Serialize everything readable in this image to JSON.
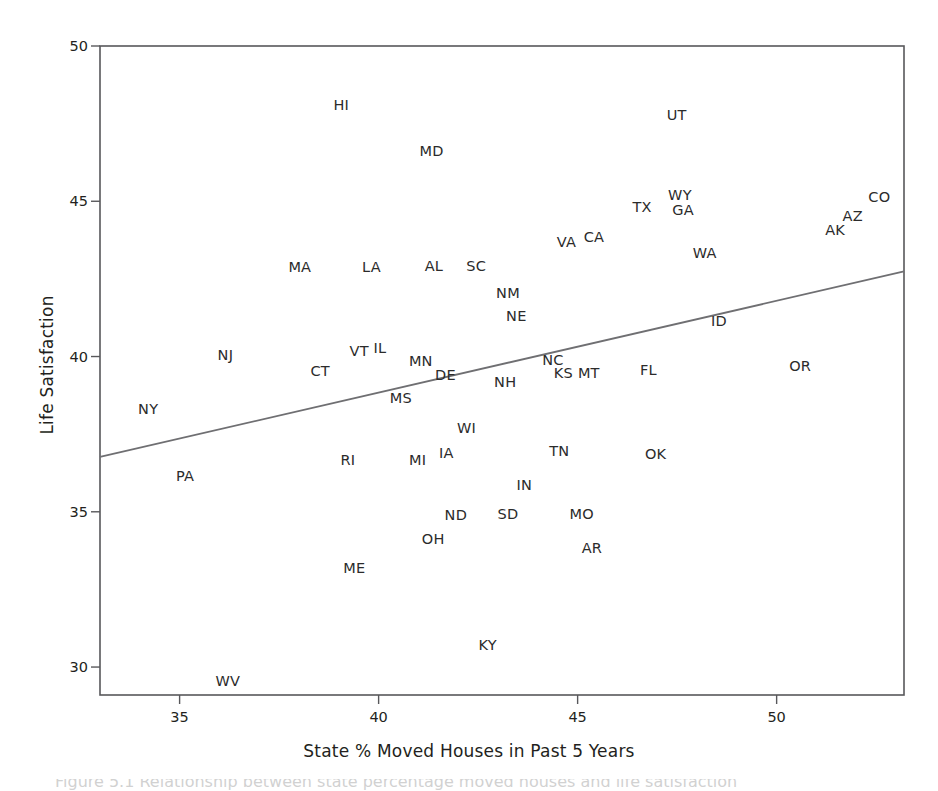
{
  "figure": {
    "background_color": "#ffffff",
    "ink_color": "#231f20",
    "line_color": "#6f6f72",
    "frame_color": "#58585b"
  },
  "caption": {
    "text": "Figure 5.1  Relationship between state percentage moved houses and life satisfaction"
  },
  "chart_data": {
    "type": "scatter",
    "title": "",
    "xlabel": "State % Moved Houses in Past 5 Years",
    "ylabel": "Life Satisfaction",
    "xlim": [
      33.0,
      53.2
    ],
    "ylim": [
      29.1,
      50.0
    ],
    "xticks": [
      35,
      40,
      45,
      50
    ],
    "xtick_labels": [
      "35",
      "40",
      "45",
      "50"
    ],
    "yticks": [
      30,
      35,
      40,
      45,
      50
    ],
    "ytick_labels": [
      "30",
      "35",
      "40",
      "45",
      "50"
    ],
    "grid": false,
    "legend": null,
    "point_marker": "text-label",
    "labels": [
      "HI",
      "UT",
      "MD",
      "CO",
      "WY",
      "TX",
      "GA",
      "AZ",
      "AK",
      "CA",
      "VA",
      "WA",
      "AL",
      "SC",
      "MA",
      "LA",
      "NM",
      "NE",
      "ID",
      "IL",
      "VT",
      "MN",
      "NJ",
      "NC",
      "DE",
      "CT",
      "OR",
      "FL",
      "MT",
      "KS",
      "NH",
      "MS",
      "NY",
      "WI",
      "IA",
      "TN",
      "OK",
      "MI",
      "RI",
      "PA",
      "IN",
      "SD",
      "MO",
      "ND",
      "AR",
      "OH",
      "ME",
      "KY",
      "WV"
    ],
    "points": [
      {
        "label": "HI",
        "x": 39.06,
        "y": 48.1
      },
      {
        "label": "UT",
        "x": 47.49,
        "y": 47.77
      },
      {
        "label": "MD",
        "x": 41.33,
        "y": 46.61
      },
      {
        "label": "CO",
        "x": 52.58,
        "y": 45.13
      },
      {
        "label": "WY",
        "x": 47.57,
        "y": 45.19
      },
      {
        "label": "TX",
        "x": 46.62,
        "y": 44.81
      },
      {
        "label": "GA",
        "x": 47.65,
        "y": 44.71
      },
      {
        "label": "AZ",
        "x": 51.91,
        "y": 44.52
      },
      {
        "label": "AK",
        "x": 51.47,
        "y": 44.06
      },
      {
        "label": "CA",
        "x": 45.41,
        "y": 43.84
      },
      {
        "label": "VA",
        "x": 44.72,
        "y": 43.68
      },
      {
        "label": "WA",
        "x": 48.19,
        "y": 43.32
      },
      {
        "label": "AL",
        "x": 41.39,
        "y": 42.9
      },
      {
        "label": "SC",
        "x": 42.45,
        "y": 42.9
      },
      {
        "label": "MA",
        "x": 38.02,
        "y": 42.87
      },
      {
        "label": "LA",
        "x": 39.82,
        "y": 42.87
      },
      {
        "label": "NM",
        "x": 43.25,
        "y": 42.03
      },
      {
        "label": "NE",
        "x": 43.46,
        "y": 41.32
      },
      {
        "label": "ID",
        "x": 48.55,
        "y": 41.13
      },
      {
        "label": "IL",
        "x": 40.03,
        "y": 40.29
      },
      {
        "label": "VT",
        "x": 39.51,
        "y": 40.19
      },
      {
        "label": "MN",
        "x": 41.06,
        "y": 39.87
      },
      {
        "label": "NJ",
        "x": 36.15,
        "y": 40.06
      },
      {
        "label": "NC",
        "x": 44.38,
        "y": 39.9
      },
      {
        "label": "DE",
        "x": 41.68,
        "y": 39.42
      },
      {
        "label": "CT",
        "x": 38.53,
        "y": 39.52
      },
      {
        "label": "OR",
        "x": 50.59,
        "y": 39.71
      },
      {
        "label": "FL",
        "x": 46.78,
        "y": 39.58
      },
      {
        "label": "MT",
        "x": 45.28,
        "y": 39.48
      },
      {
        "label": "KS",
        "x": 44.64,
        "y": 39.48
      },
      {
        "label": "NH",
        "x": 43.18,
        "y": 39.19
      },
      {
        "label": "MS",
        "x": 40.56,
        "y": 38.68
      },
      {
        "label": "NY",
        "x": 34.21,
        "y": 38.32
      },
      {
        "label": "WI",
        "x": 42.21,
        "y": 37.71
      },
      {
        "label": "IA",
        "x": 41.7,
        "y": 36.9
      },
      {
        "label": "TN",
        "x": 44.54,
        "y": 36.97
      },
      {
        "label": "OK",
        "x": 46.96,
        "y": 36.87
      },
      {
        "label": "MI",
        "x": 40.98,
        "y": 36.68
      },
      {
        "label": "RI",
        "x": 39.23,
        "y": 36.68
      },
      {
        "label": "PA",
        "x": 35.14,
        "y": 36.16
      },
      {
        "label": "IN",
        "x": 43.66,
        "y": 35.87
      },
      {
        "label": "SD",
        "x": 43.25,
        "y": 34.94
      },
      {
        "label": "MO",
        "x": 45.1,
        "y": 34.94
      },
      {
        "label": "ND",
        "x": 41.94,
        "y": 34.9
      },
      {
        "label": "AR",
        "x": 45.36,
        "y": 33.84
      },
      {
        "label": "OH",
        "x": 41.37,
        "y": 34.13
      },
      {
        "label": "ME",
        "x": 39.39,
        "y": 33.19
      },
      {
        "label": "KY",
        "x": 42.74,
        "y": 30.71
      },
      {
        "label": "WV",
        "x": 36.21,
        "y": 29.55
      }
    ],
    "fit_line": {
      "name": "regression-line",
      "x0": 33.0,
      "y0": 36.77,
      "x1": 53.2,
      "y1": 42.74
    }
  }
}
